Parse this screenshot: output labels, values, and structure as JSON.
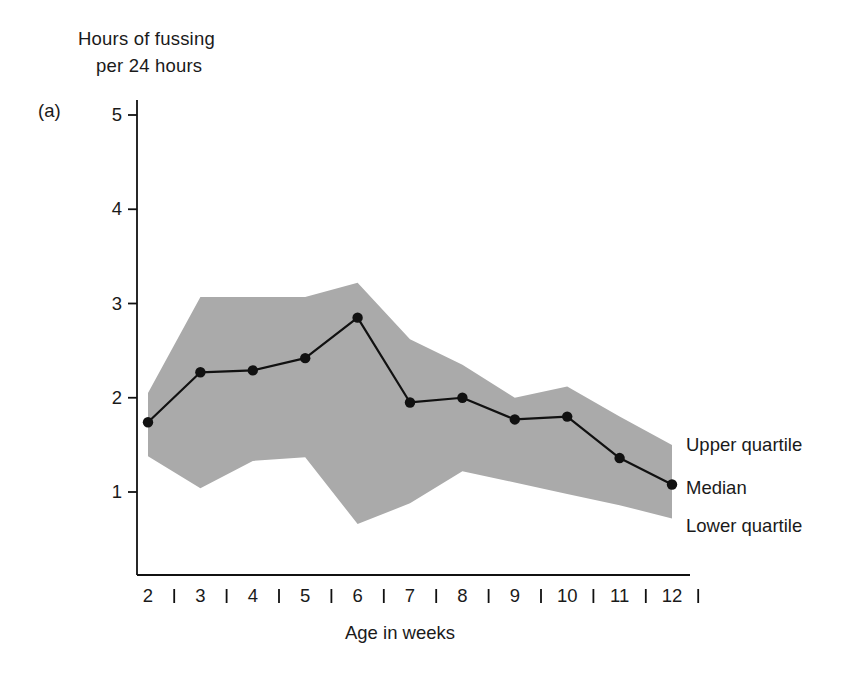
{
  "figure": {
    "panel_label": "(a)",
    "y_axis_title_line1": "Hours of fussing",
    "y_axis_title_line2": "per 24 hours",
    "x_axis_title": "Age in weeks"
  },
  "legend": {
    "upper": "Upper quartile",
    "median": "Median",
    "lower": "Lower quartile"
  },
  "colors": {
    "band_fill": "#aaaaaa",
    "line": "#111111",
    "axis": "#111111",
    "text": "#1a1a1a",
    "background": "#ffffff"
  },
  "chart_data": {
    "type": "line",
    "title": "",
    "subtitle": "",
    "xlabel": "Age in weeks",
    "ylabel": "Hours of fussing per 24 hours",
    "xlim": [
      2,
      12
    ],
    "ylim": [
      0.45,
      5.35
    ],
    "xticks": [
      2,
      3,
      4,
      5,
      6,
      7,
      8,
      9,
      10,
      11,
      12
    ],
    "yticks": [
      1,
      2,
      3,
      4,
      5
    ],
    "xtick_labels": [
      "2",
      "3",
      "4",
      "5",
      "6",
      "7",
      "8",
      "9",
      "10",
      "11",
      "12"
    ],
    "ytick_labels": [
      "1",
      "2",
      "3",
      "4",
      "5"
    ],
    "grid": false,
    "legend_position": "right",
    "x": [
      2,
      3,
      4,
      5,
      6,
      7,
      8,
      9,
      10,
      11,
      12
    ],
    "series": [
      {
        "name": "Upper quartile",
        "values": [
          2.05,
          3.07,
          3.07,
          3.07,
          3.22,
          2.62,
          2.35,
          2.0,
          2.12,
          1.8,
          1.5
        ]
      },
      {
        "name": "Median",
        "values": [
          1.74,
          2.27,
          2.29,
          2.42,
          2.85,
          1.95,
          2.0,
          1.77,
          1.8,
          1.36,
          1.08
        ]
      },
      {
        "name": "Lower quartile",
        "values": [
          1.38,
          1.04,
          1.33,
          1.37,
          0.66,
          0.88,
          1.22,
          1.1,
          0.98,
          0.86,
          0.72
        ]
      }
    ]
  }
}
